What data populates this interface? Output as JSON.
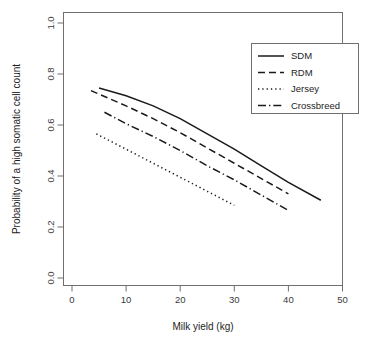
{
  "chart_data": {
    "type": "line",
    "title": "",
    "xlabel": "Milk yield (kg)",
    "ylabel": "Probability of a high somatic cell count",
    "xlim": [
      0,
      50
    ],
    "ylim": [
      0.0,
      1.0
    ],
    "xticks": [
      0,
      10,
      20,
      30,
      40,
      50
    ],
    "xtick_labels": [
      "0",
      "10",
      "20",
      "30",
      "40",
      "50"
    ],
    "yticks": [
      0.0,
      0.2,
      0.4,
      0.6,
      0.8,
      1.0
    ],
    "ytick_labels": [
      "0.0",
      "0.2",
      "0.4",
      "0.6",
      "0.8",
      "1.0"
    ],
    "grid": false,
    "legend_position": "top-right",
    "series": [
      {
        "name": "SDM",
        "style": "solid",
        "color": "#1a1a1a",
        "x": [
          5,
          10,
          15,
          20,
          25,
          30,
          35,
          40,
          46
        ],
        "y": [
          0.745,
          0.715,
          0.675,
          0.625,
          0.565,
          0.505,
          0.44,
          0.375,
          0.305
        ]
      },
      {
        "name": "RDM",
        "style": "dashed",
        "color": "#1a1a1a",
        "x": [
          3.5,
          10,
          15,
          20,
          25,
          30,
          35,
          40
        ],
        "y": [
          0.735,
          0.675,
          0.625,
          0.57,
          0.51,
          0.45,
          0.39,
          0.33
        ]
      },
      {
        "name": "Jersey",
        "style": "dotted",
        "color": "#1a1a1a",
        "x": [
          4.5,
          10,
          15,
          20,
          25,
          30
        ],
        "y": [
          0.565,
          0.505,
          0.45,
          0.395,
          0.34,
          0.285
        ]
      },
      {
        "name": "Crossbreed",
        "style": "dashdot",
        "color": "#1a1a1a",
        "x": [
          6,
          10,
          15,
          20,
          25,
          30,
          35,
          40
        ],
        "y": [
          0.65,
          0.605,
          0.555,
          0.5,
          0.44,
          0.385,
          0.325,
          0.265
        ]
      }
    ]
  },
  "legend": {
    "items": [
      {
        "label": "SDM",
        "style": "solid"
      },
      {
        "label": "RDM",
        "style": "dashed"
      },
      {
        "label": "Jersey",
        "style": "dotted"
      },
      {
        "label": "Crossbreed",
        "style": "dashdot"
      }
    ]
  },
  "colors": {
    "axis": "#6f6f6f",
    "text": "#1c1c1c",
    "line": "#1a1a1a",
    "background": "#ffffff"
  }
}
